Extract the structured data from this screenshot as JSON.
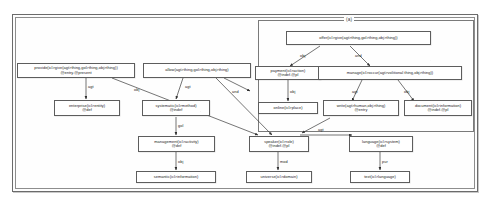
{
  "figure": {
    "subgraph_label": "(a)",
    "colors": {
      "frame": "#6b6b6b",
      "node_border": "#5d5d5d",
      "node_fill": "#ffffff",
      "edge": "#3a3a3a",
      "text": "#1b1b1b",
      "background": "#ffffff"
    }
  },
  "nodes": [
    {
      "id": "provide",
      "label": "provide(icl>give(agt>thing,gol>thing,obj>thing))\n@entry.@present"
    },
    {
      "id": "allow",
      "label": "allow(agt>thing,gol>thing,obj>thing)"
    },
    {
      "id": "offer",
      "label": "offer(icl>give(agt>thing,gol>thing,obj>thing))"
    },
    {
      "id": "payment",
      "label": "payment(icl>action)\n@indef.@pl"
    },
    {
      "id": "manage",
      "label": "manage(icl>occur(agt>volitional thing,obj>thing))"
    },
    {
      "id": "enterprise",
      "label": "enterprise(icl>entity)\n@def"
    },
    {
      "id": "systematic",
      "label": "systematic(icl>method)\n@indef"
    },
    {
      "id": "online",
      "label": "online(icl>place)"
    },
    {
      "id": "write",
      "label": "write(agt>human,obj>thing)\n@entry"
    },
    {
      "id": "document",
      "label": "document(icl>information)\n@indef.@pl"
    },
    {
      "id": "management",
      "label": "management(icl>activity)\n@def"
    },
    {
      "id": "speaker",
      "label": "speaker(icl>role)\n@indef.@pl"
    },
    {
      "id": "language",
      "label": "language(icl>system)\n@def"
    },
    {
      "id": "semantic",
      "label": "semantic(icl>information)"
    },
    {
      "id": "universe",
      "label": "universe(icl>domain)"
    },
    {
      "id": "text",
      "label": "text(icl>language)"
    }
  ],
  "edges": [
    {
      "id": "e1",
      "label": "agt",
      "from": "provide",
      "to": "enterprise"
    },
    {
      "id": "e2",
      "label": "obj",
      "from": "provide",
      "to": "speaker"
    },
    {
      "id": "e3",
      "label": "agt",
      "from": "allow",
      "to": "systematic"
    },
    {
      "id": "e4",
      "label": "and",
      "from": "allow",
      "to": "speaker"
    },
    {
      "id": "e5",
      "label": "obj",
      "from": "offer",
      "to": "payment"
    },
    {
      "id": "e6",
      "label": "and",
      "from": "offer",
      "to": "manage"
    },
    {
      "id": "e7",
      "label": "obj",
      "from": "payment",
      "to": "online"
    },
    {
      "id": "e8",
      "label": "agt",
      "from": "manage",
      "to": "write"
    },
    {
      "id": "e9",
      "label": "obj",
      "from": "manage",
      "to": "document"
    },
    {
      "id": "e10",
      "label": "gol",
      "from": "systematic",
      "to": "management"
    },
    {
      "id": "e11",
      "label": "obj",
      "from": "management",
      "to": "semantic"
    },
    {
      "id": "e12",
      "label": "agt",
      "from": "speaker",
      "to": "language"
    },
    {
      "id": "e13",
      "label": "mod",
      "from": "speaker",
      "to": "universe"
    },
    {
      "id": "e14",
      "label": "pur",
      "from": "language",
      "to": "text"
    }
  ]
}
